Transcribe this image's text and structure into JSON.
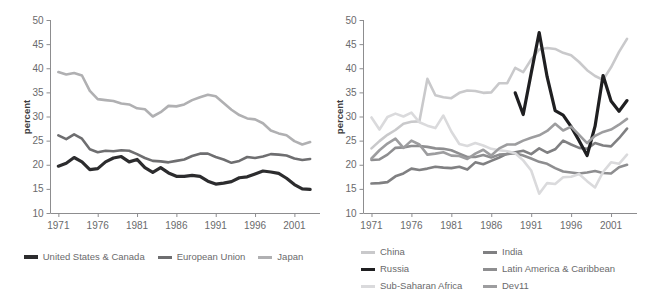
{
  "figure": {
    "panels": [
      {
        "id": "left",
        "ylabel": "percent",
        "legend": [
          {
            "label": "United States & Canada",
            "color": "#2c2c2e",
            "width": 3.2
          },
          {
            "label": "European Union",
            "color": "#6e6e70",
            "width": 2.6
          },
          {
            "label": "Japan",
            "color": "#b0b0b2",
            "width": 2.6
          }
        ]
      },
      {
        "id": "right",
        "ylabel": "percent",
        "legend": [
          {
            "label": "China",
            "color": "#c9c9cb",
            "width": 2.6
          },
          {
            "label": "India",
            "color": "#808082",
            "width": 2.6
          },
          {
            "label": "Russia",
            "color": "#1f1f21",
            "width": 3.2
          },
          {
            "label": "Latin America & Caribbean",
            "color": "#8e8e90",
            "width": 2.6
          },
          {
            "label": "Sub-Saharan Africa",
            "color": "#dadadc",
            "width": 2.6
          },
          {
            "label": "Dev11",
            "color": "#9d9d9f",
            "width": 2.6
          }
        ]
      }
    ]
  },
  "chart_data": [
    {
      "type": "line",
      "title": "",
      "xlabel": "",
      "ylabel": "percent",
      "xlim": [
        1970,
        2004
      ],
      "ylim": [
        10,
        50
      ],
      "yticks": [
        10,
        15,
        20,
        25,
        30,
        35,
        40,
        45,
        50
      ],
      "xticks": [
        1971,
        1976,
        1981,
        1986,
        1991,
        1996,
        2001
      ],
      "grid": false,
      "legend_position": "bottom",
      "x": [
        1971,
        1972,
        1973,
        1974,
        1975,
        1976,
        1977,
        1978,
        1979,
        1980,
        1981,
        1982,
        1983,
        1984,
        1985,
        1986,
        1987,
        1988,
        1989,
        1990,
        1991,
        1992,
        1993,
        1994,
        1995,
        1996,
        1997,
        1998,
        1999,
        2000,
        2001,
        2002,
        2003
      ],
      "series": [
        {
          "name": "United States & Canada",
          "color": "#2c2c2e",
          "values": [
            19.7,
            20.3,
            21.5,
            20.6,
            19.0,
            19.2,
            20.6,
            21.4,
            21.7,
            20.6,
            21.1,
            19.4,
            18.4,
            19.4,
            18.3,
            17.6,
            17.6,
            17.8,
            17.6,
            16.6,
            16.0,
            16.2,
            16.5,
            17.3,
            17.5,
            18.1,
            18.7,
            18.5,
            18.2,
            17.2,
            15.9,
            15.0,
            14.9
          ]
        },
        {
          "name": "European Union",
          "color": "#6e6e70",
          "values": [
            26.1,
            25.3,
            26.3,
            25.4,
            23.2,
            22.6,
            22.9,
            22.8,
            23.0,
            22.9,
            22.2,
            21.4,
            20.8,
            20.7,
            20.5,
            20.8,
            21.1,
            21.8,
            22.3,
            22.3,
            21.6,
            21.1,
            20.4,
            20.8,
            21.6,
            21.4,
            21.7,
            22.2,
            22.1,
            21.9,
            21.3,
            21.0,
            21.2
          ]
        },
        {
          "name": "Japan",
          "color": "#b0b0b2",
          "values": [
            39.2,
            38.7,
            39.0,
            38.5,
            35.3,
            33.6,
            33.4,
            33.2,
            32.7,
            32.5,
            31.7,
            31.5,
            30.0,
            30.9,
            32.2,
            32.1,
            32.5,
            33.4,
            34.0,
            34.5,
            34.2,
            32.8,
            31.4,
            30.3,
            29.6,
            29.4,
            28.6,
            27.1,
            26.5,
            26.1,
            24.9,
            24.2,
            24.7
          ]
        }
      ]
    },
    {
      "type": "line",
      "title": "",
      "xlabel": "",
      "ylabel": "percent",
      "xlim": [
        1970,
        2004
      ],
      "ylim": [
        10,
        50
      ],
      "yticks": [
        10,
        15,
        20,
        25,
        30,
        35,
        40,
        45,
        50
      ],
      "xticks": [
        1971,
        1976,
        1981,
        1986,
        1991,
        1996,
        2001
      ],
      "grid": false,
      "legend_position": "bottom",
      "x": [
        1971,
        1972,
        1973,
        1974,
        1975,
        1976,
        1977,
        1978,
        1979,
        1980,
        1981,
        1982,
        1983,
        1984,
        1985,
        1986,
        1987,
        1988,
        1989,
        1990,
        1991,
        1992,
        1993,
        1994,
        1995,
        1996,
        1997,
        1998,
        1999,
        2000,
        2001,
        2002,
        2003
      ],
      "series": [
        {
          "name": "China",
          "color": "#c9c9cb",
          "values": [
            23.4,
            24.9,
            26.2,
            27.2,
            28.5,
            28.9,
            29.0,
            37.8,
            34.4,
            34.0,
            33.8,
            34.9,
            35.4,
            35.3,
            34.9,
            35.0,
            36.9,
            36.9,
            40.1,
            39.2,
            41.8,
            43.9,
            44.2,
            44.0,
            43.2,
            42.7,
            41.3,
            39.6,
            38.4,
            37.6,
            40.2,
            43.4,
            46.1
          ]
        },
        {
          "name": "India",
          "color": "#808082",
          "values": [
            16.1,
            16.2,
            16.4,
            17.6,
            18.2,
            19.2,
            18.9,
            19.2,
            19.6,
            19.4,
            19.3,
            19.6,
            19.0,
            20.5,
            20.1,
            20.8,
            21.5,
            22.3,
            22.6,
            22.9,
            22.2,
            23.4,
            22.5,
            23.2,
            25.0,
            24.2,
            23.5,
            23.3,
            24.5,
            24.0,
            23.8,
            25.5,
            27.5
          ]
        },
        {
          "name": "Russia",
          "color": "#1f1f21",
          "values": [
            null,
            null,
            null,
            null,
            null,
            null,
            null,
            null,
            null,
            null,
            null,
            null,
            null,
            null,
            null,
            null,
            null,
            null,
            34.9,
            30.4,
            39.0,
            47.4,
            38.2,
            31.2,
            30.3,
            27.9,
            25.0,
            21.9,
            28.0,
            38.5,
            33.2,
            31.1,
            33.3
          ]
        },
        {
          "name": "Latin America & Caribbean",
          "color": "#8e8e90",
          "values": [
            21.0,
            21.1,
            22.1,
            23.5,
            23.6,
            23.9,
            23.9,
            23.7,
            23.4,
            23.3,
            23.0,
            22.3,
            21.6,
            21.6,
            22.0,
            21.5,
            22.1,
            22.2,
            22.4,
            21.9,
            21.3,
            20.6,
            20.2,
            19.3,
            18.6,
            18.4,
            18.2,
            18.4,
            18.7,
            18.3,
            18.2,
            19.5,
            20.0
          ]
        },
        {
          "name": "Sub-Saharan Africa",
          "color": "#dadadc",
          "values": [
            29.8,
            27.3,
            29.9,
            30.6,
            30.0,
            30.8,
            28.8,
            28.1,
            27.6,
            30.2,
            26.9,
            24.3,
            23.9,
            24.5,
            24.0,
            23.3,
            23.0,
            22.8,
            22.4,
            20.9,
            18.8,
            14.0,
            16.2,
            16.0,
            17.4,
            17.5,
            18.1,
            16.6,
            15.3,
            18.5,
            20.5,
            20.2,
            22.1
          ]
        },
        {
          "name": "Dev11",
          "color": "#9d9d9f",
          "values": [
            21.3,
            23.0,
            24.4,
            25.4,
            23.5,
            25.0,
            24.2,
            22.1,
            22.3,
            22.6,
            21.9,
            21.8,
            21.2,
            22.3,
            23.1,
            21.9,
            23.4,
            24.2,
            24.2,
            25.0,
            25.6,
            26.1,
            27.0,
            28.5,
            27.1,
            27.9,
            26.2,
            24.5,
            26.0,
            26.8,
            27.3,
            28.3,
            29.5
          ]
        }
      ]
    }
  ]
}
